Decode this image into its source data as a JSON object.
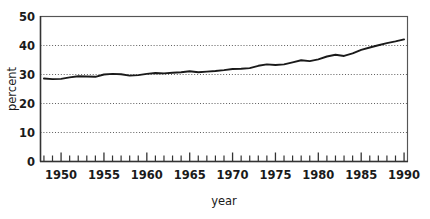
{
  "chart_data": {
    "type": "line",
    "title": "",
    "xlabel": "year",
    "ylabel": "percent",
    "xlim": [
      1947.6,
      1990.4
    ],
    "ylim": [
      0,
      50
    ],
    "grid": true,
    "grid_values": [
      10,
      20,
      30,
      40
    ],
    "legend": "none",
    "y_ticks": [
      0,
      10,
      20,
      30,
      40,
      50
    ],
    "y_tick_labels": [
      "0",
      "10",
      "20",
      "30",
      "40",
      "50"
    ],
    "x_tick_labels": [
      "1950",
      "1955",
      "1960",
      "1965",
      "1970",
      "1975",
      "1980",
      "1985",
      "1990"
    ],
    "x_tick_label_values": [
      1950,
      1955,
      1960,
      1965,
      1970,
      1975,
      1980,
      1985,
      1990
    ],
    "x_minor_ticks": [
      1948,
      1949,
      1950,
      1951,
      1952,
      1953,
      1954,
      1955,
      1956,
      1957,
      1958,
      1959,
      1960,
      1961,
      1962,
      1963,
      1964,
      1965,
      1966,
      1967,
      1968,
      1969,
      1970,
      1971,
      1972,
      1973,
      1974,
      1975,
      1976,
      1977,
      1978,
      1979,
      1980,
      1981,
      1982,
      1983,
      1984,
      1985,
      1986,
      1987,
      1988,
      1989,
      1990
    ],
    "series": [
      {
        "name": "percent",
        "x": [
          1948,
          1949,
          1950,
          1951,
          1952,
          1953,
          1954,
          1955,
          1956,
          1957,
          1958,
          1959,
          1960,
          1961,
          1962,
          1963,
          1964,
          1965,
          1966,
          1967,
          1968,
          1969,
          1970,
          1971,
          1972,
          1973,
          1974,
          1975,
          1976,
          1977,
          1978,
          1979,
          1980,
          1981,
          1982,
          1983,
          1984,
          1985,
          1986,
          1987,
          1988,
          1989,
          1990
        ],
        "values": [
          28.6,
          28.4,
          28.5,
          29.0,
          29.4,
          29.3,
          29.2,
          30.0,
          30.2,
          30.1,
          29.6,
          29.8,
          30.2,
          30.5,
          30.4,
          30.6,
          30.8,
          31.1,
          30.8,
          31.0,
          31.2,
          31.5,
          31.9,
          32.0,
          32.2,
          33.0,
          33.5,
          33.3,
          33.5,
          34.2,
          34.9,
          34.6,
          35.2,
          36.2,
          36.8,
          36.4,
          37.3,
          38.5,
          39.3,
          40.1,
          40.8,
          41.4,
          42.1
        ]
      }
    ]
  },
  "figure": {
    "ylabel_text": "percent",
    "xlabel_text": "year"
  }
}
